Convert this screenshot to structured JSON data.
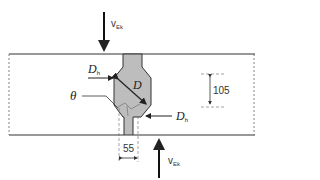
{
  "diagram": {
    "type": "cross-section schematic",
    "colors": {
      "line": "#333333",
      "fill": "#bdbdbd",
      "dashed": "#666666"
    },
    "labels": {
      "v_top": {
        "main": "v",
        "sub": "Ek"
      },
      "v_bottom": {
        "main": "v",
        "sub": "Ek"
      },
      "dh_left": {
        "main": "D",
        "sub": "h"
      },
      "dh_right": {
        "main": "D",
        "sub": "h"
      },
      "d": "D",
      "theta": "θ",
      "dim_height": "105",
      "dim_width": "55"
    },
    "arrows": [
      {
        "name": "load-arrow-top",
        "direction": "down"
      },
      {
        "name": "load-arrow-bottom",
        "direction": "up"
      }
    ]
  }
}
